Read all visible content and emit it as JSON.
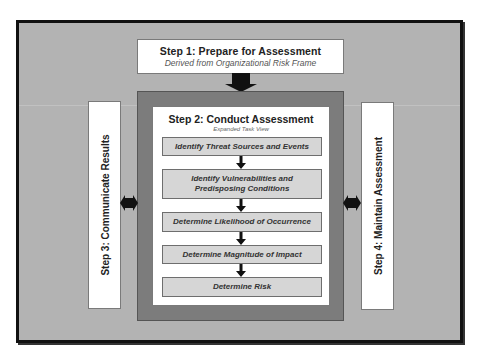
{
  "diagram": {
    "step1": {
      "title": "Step 1: Prepare for Assessment",
      "subtitle": "Derived from Organizational Risk Frame"
    },
    "step2": {
      "title": "Step 2: Conduct Assessment",
      "subtitle": "Expanded Task View",
      "tasks": [
        "Identify Threat Sources and Events",
        "Identify Vulnerabilities and Predisposing Conditions",
        "Determine Likelihood of Occurrence",
        "Determine Magnitude of Impact",
        "Determine Risk"
      ]
    },
    "step3": {
      "title": "Step 3: Communicate Results"
    },
    "step4": {
      "title": "Step 4: Maintain Assessment"
    },
    "colors": {
      "frame_background": "#b3b3b3",
      "frame_border": "#111111",
      "step2_outer": "#7c7c7c",
      "task_fill": "#d6d6d6",
      "arrow": "#111111"
    }
  }
}
